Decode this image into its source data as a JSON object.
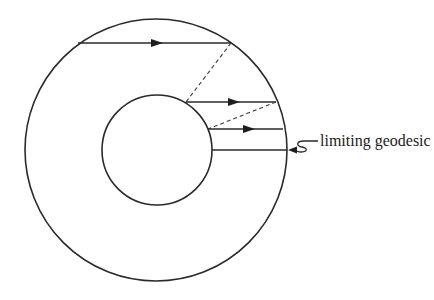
{
  "diagram": {
    "type": "annulus-geodesics",
    "outer_circle": {
      "cx": 156,
      "cy": 150,
      "r": 131
    },
    "inner_circle": {
      "cx": 157,
      "cy": 150,
      "r": 55
    },
    "geodesics": [
      {
        "x1": 78,
        "y1": 43,
        "x2": 231,
        "y2": 43,
        "arrow_x": 157,
        "direction": "right"
      },
      {
        "x1": 186,
        "y1": 102,
        "x2": 276,
        "y2": 102,
        "arrow_x": 234,
        "direction": "right"
      },
      {
        "x1": 208,
        "y1": 129,
        "x2": 283,
        "y2": 129,
        "arrow_x": 249,
        "direction": "right"
      },
      {
        "x1": 212,
        "y1": 150,
        "x2": 287,
        "y2": 150,
        "direction": "none",
        "limiting": true
      }
    ],
    "dashed_links": [
      {
        "x1": 231,
        "y1": 43,
        "x2": 186,
        "y2": 102
      },
      {
        "x1": 276,
        "y1": 102,
        "x2": 208,
        "y2": 129
      }
    ],
    "label": {
      "text": "limiting geodesic",
      "x": 316,
      "y": 146
    },
    "colors": {
      "ink": "#2a2a2a",
      "background": "#ffffff"
    }
  }
}
